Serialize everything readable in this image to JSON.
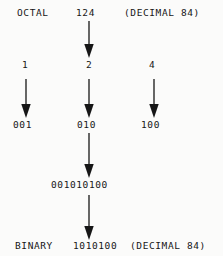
{
  "diagram": {
    "background_color": "#fbfbfa",
    "ink_color": "#161616",
    "rows": {
      "octal": {
        "label": "OCTAL",
        "value": "124",
        "decimal_note": "(DECIMAL 84)"
      },
      "digits": {
        "digit_1": "1",
        "digit_2": "2",
        "digit_3": "4"
      },
      "triplets": {
        "triplet_1": "001",
        "triplet_2": "010",
        "triplet_3": "100"
      },
      "concatenated": {
        "value": "001010100"
      },
      "binary": {
        "label": "BINARY",
        "value": "1010100",
        "decimal_note": "(DECIMAL 84)"
      }
    },
    "arrows": {
      "octal_to_digits": "down-arrow",
      "digit_1_to_triplet": "down-arrow",
      "digit_2_to_triplet": "down-arrow",
      "digit_3_to_triplet": "down-arrow",
      "triplets_to_concatenated": "down-arrow",
      "concatenated_to_binary": "down-arrow"
    }
  }
}
